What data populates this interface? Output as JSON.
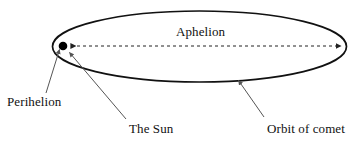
{
  "diagram": {
    "type": "comet-orbit-diagram",
    "labels": {
      "aphelion": "Aphelion",
      "perihelion": "Perihelion",
      "the_sun": "The Sun",
      "orbit_of_comet": "Orbit of comet"
    },
    "colors": {
      "background": "#ffffff",
      "stroke": "#111111",
      "text": "#111111",
      "sun_fill": "#000000",
      "leader_line": "#555555",
      "dashed_axis": "#222222"
    },
    "elements": {
      "orbit_ellipse": {
        "name": "orbit-ellipse",
        "center_x": 199.5,
        "center_y": 46.5,
        "radius_x": 147,
        "radius_y": 35.5,
        "stroke_width": 1.6
      },
      "sun": {
        "name": "sun-dot",
        "cx": 63,
        "cy": 46,
        "r": 4.2
      },
      "aphelion_axis": {
        "name": "aphelion-dashed-arrow",
        "x1": 69,
        "y1": 46,
        "x2": 343,
        "y2": 46,
        "dash": "3 3",
        "arrowheads": "both"
      },
      "perihelion_leader": {
        "name": "perihelion-leader-line",
        "x1": 46,
        "y1": 93,
        "x2": 59,
        "y2": 49
      },
      "sun_leader": {
        "name": "sun-leader-line",
        "x1": 126,
        "y1": 119,
        "x2": 69,
        "y2": 52
      },
      "orbit_leader": {
        "name": "orbit-leader-line",
        "x1": 264,
        "y1": 117,
        "x2": 238,
        "y2": 80
      }
    }
  }
}
